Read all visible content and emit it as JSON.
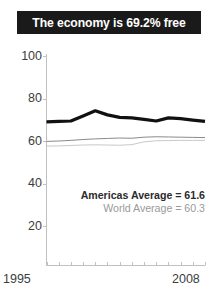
{
  "title": {
    "text": "The economy is 69.2% free"
  },
  "legend": {
    "americas": "Americas Average = 61.6",
    "world": "World Average = 60.3"
  },
  "axis": {
    "x_start_label": "1995",
    "x_end_label": "2008",
    "y_labels": [
      "100",
      "80",
      "60",
      "40",
      "20"
    ]
  },
  "colors": {
    "banner_bg": "#1a1a1a",
    "banner_text": "#ffffff",
    "country_line": "#111111",
    "americas_line": "#8a8a8a",
    "world_line": "#c9c9c9",
    "axis": "#c0c0c0",
    "tick_text": "#3d3d3d"
  },
  "chart_data": {
    "type": "line",
    "title": "The economy is 69.2% free",
    "xlabel": "",
    "ylabel": "",
    "xlim": [
      1995,
      2008
    ],
    "ylim": [
      0,
      100
    ],
    "yticks": [
      20,
      40,
      60,
      80,
      100
    ],
    "grid": false,
    "legend_position": "inside-lower-right",
    "x": [
      1995,
      1996,
      1997,
      1998,
      1999,
      2000,
      2001,
      2002,
      2003,
      2004,
      2005,
      2006,
      2007,
      2008
    ],
    "series": [
      {
        "name": "Country",
        "color": "#111111",
        "linewidth": 3.2,
        "values": [
          69.0,
          69.2,
          69.4,
          71.8,
          74.2,
          72.3,
          71.1,
          70.9,
          70.2,
          69.4,
          70.9,
          70.5,
          69.8,
          69.2
        ]
      },
      {
        "name": "Americas Average",
        "color": "#8a8a8a",
        "linewidth": 1.0,
        "label_value": 61.6,
        "values": [
          59.8,
          60.0,
          60.3,
          60.7,
          61.0,
          61.2,
          61.4,
          61.3,
          61.8,
          62.0,
          61.9,
          61.8,
          61.7,
          61.6
        ]
      },
      {
        "name": "World Average",
        "color": "#c9c9c9",
        "linewidth": 1.0,
        "label_value": 60.3,
        "values": [
          57.6,
          57.7,
          57.9,
          58.1,
          58.2,
          58.1,
          58.0,
          58.3,
          59.6,
          60.1,
          60.2,
          60.3,
          60.3,
          60.3
        ]
      }
    ],
    "annotations": [
      {
        "text": "Americas Average = 61.6",
        "style": "bold"
      },
      {
        "text": "World Average = 60.3",
        "style": "muted"
      }
    ]
  }
}
